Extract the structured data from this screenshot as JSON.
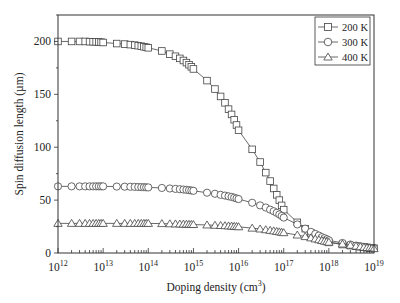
{
  "chart_data": {
    "type": "line",
    "title": "",
    "xlabel": "Doping density (cm3)",
    "xlabel_main": "Doping density (cm",
    "xlabel_sup": "3",
    "xlabel_close": ")",
    "ylabel": "Spin diffusion length (µm)",
    "xscale": "log",
    "xlim": [
      1000000000000.0,
      1e+19
    ],
    "ylim": [
      0,
      225
    ],
    "x_ticks": [
      {
        "exp": 12,
        "base": "10",
        "sup": "12"
      },
      {
        "exp": 13,
        "base": "10",
        "sup": "13"
      },
      {
        "exp": 14,
        "base": "10",
        "sup": "14"
      },
      {
        "exp": 15,
        "base": "10",
        "sup": "15"
      },
      {
        "exp": 16,
        "base": "10",
        "sup": "16"
      },
      {
        "exp": 17,
        "base": "10",
        "sup": "17"
      },
      {
        "exp": 18,
        "base": "10",
        "sup": "18"
      },
      {
        "exp": 19,
        "base": "10",
        "sup": "19"
      }
    ],
    "y_ticks": [
      0,
      50,
      100,
      150,
      200
    ],
    "grid": false,
    "legend_position": "top-right",
    "x_log10": [
      12,
      12.301,
      12.477,
      12.602,
      12.699,
      12.778,
      12.845,
      12.903,
      12.954,
      13,
      13.301,
      13.477,
      13.602,
      13.699,
      13.778,
      13.845,
      13.903,
      13.954,
      14,
      14.301,
      14.477,
      14.602,
      14.699,
      14.778,
      14.845,
      14.903,
      14.954,
      15,
      15.301,
      15.477,
      15.602,
      15.699,
      15.778,
      15.845,
      15.903,
      15.954,
      16,
      16.301,
      16.477,
      16.602,
      16.699,
      16.778,
      16.845,
      16.903,
      16.954,
      17,
      17.301,
      17.477,
      17.602,
      17.699,
      17.778,
      17.845,
      17.903,
      17.954,
      18,
      18.301,
      18.477,
      18.602,
      18.699,
      18.778,
      18.845,
      18.903,
      18.954,
      19
    ],
    "series": [
      {
        "name": "200 K",
        "marker": "square",
        "values": [
          200,
          200,
          200,
          200,
          199.8,
          199.7,
          199.6,
          199.5,
          199.3,
          199,
          198,
          197.5,
          197,
          196.5,
          196,
          195.5,
          195,
          194.5,
          194,
          191,
          188,
          186,
          184,
          182,
          180,
          178,
          176,
          174,
          163,
          155,
          148,
          142,
          136,
          131,
          126,
          121,
          116,
          98,
          86,
          76,
          68,
          61,
          55,
          50,
          45,
          41,
          29,
          23,
          19,
          16.5,
          14.5,
          13,
          12,
          11,
          10,
          8,
          7,
          6.5,
          6,
          5.5,
          5.2,
          5,
          4.8,
          4.5
        ]
      },
      {
        "name": "300 K",
        "marker": "circle",
        "values": [
          63,
          63,
          63,
          63,
          63,
          63,
          63,
          63,
          63,
          63,
          62.8,
          62.7,
          62.6,
          62.5,
          62.4,
          62.3,
          62.2,
          62.1,
          62,
          61.5,
          61,
          60.6,
          60.3,
          60,
          59.7,
          59.4,
          59.1,
          58.8,
          57,
          56,
          55,
          54.3,
          53.6,
          53,
          52.3,
          51.6,
          51,
          47.5,
          45,
          43,
          41,
          39.5,
          38,
          36.5,
          35,
          33.5,
          27,
          23,
          20,
          18,
          16.5,
          15,
          14,
          13,
          12,
          9.5,
          8,
          7,
          6.3,
          5.8,
          5.4,
          5,
          4.7,
          4.4
        ]
      },
      {
        "name": "400 K",
        "marker": "triangle",
        "values": [
          28,
          28,
          28,
          28,
          28,
          28,
          28,
          28,
          28,
          28,
          28,
          28,
          28,
          28,
          28,
          28,
          28,
          28,
          28,
          27.8,
          27.6,
          27.5,
          27.4,
          27.3,
          27.2,
          27.1,
          27,
          26.9,
          26.5,
          26.2,
          26,
          25.8,
          25.6,
          25.4,
          25.2,
          25,
          24.8,
          23.5,
          22.7,
          22,
          21.4,
          20.9,
          20.4,
          20,
          19.6,
          19.2,
          17,
          15.5,
          14.3,
          13.3,
          12.5,
          11.8,
          11.2,
          10.7,
          10.2,
          8.5,
          7.3,
          6.5,
          5.9,
          5.4,
          5,
          4.7,
          4.4,
          4.1
        ]
      }
    ]
  },
  "legend": {
    "items": [
      "200 K",
      "300 K",
      "400 K"
    ]
  }
}
